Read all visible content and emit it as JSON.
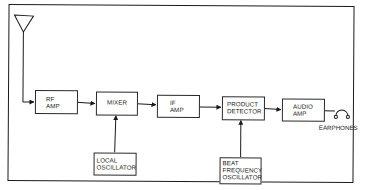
{
  "diagram": {
    "blocks": [
      {
        "id": "rf_amp",
        "lines": [
          "RF",
          "AMP"
        ]
      },
      {
        "id": "mixer",
        "lines": [
          "MIXER"
        ]
      },
      {
        "id": "if_amp",
        "lines": [
          "IF",
          "AMP"
        ]
      },
      {
        "id": "product_detector",
        "lines": [
          "PRODUCT",
          "DETECTOR"
        ]
      },
      {
        "id": "audio_amp",
        "lines": [
          "AUDIO",
          "AMP"
        ]
      },
      {
        "id": "local_oscillator",
        "lines": [
          "LOCAL",
          "OSCILLATOR"
        ]
      },
      {
        "id": "bfo",
        "lines": [
          "BEAT",
          "FREQUENCY",
          "OSCILLATOR"
        ]
      }
    ],
    "output_label": "EARPHONES",
    "connections": [
      {
        "from": "antenna",
        "to": "rf_amp"
      },
      {
        "from": "rf_amp",
        "to": "mixer"
      },
      {
        "from": "local_oscillator",
        "to": "mixer"
      },
      {
        "from": "mixer",
        "to": "if_amp"
      },
      {
        "from": "if_amp",
        "to": "product_detector"
      },
      {
        "from": "bfo",
        "to": "product_detector"
      },
      {
        "from": "product_detector",
        "to": "audio_amp"
      },
      {
        "from": "audio_amp",
        "to": "earphones"
      }
    ],
    "colors": {
      "line": "#1a1a1a",
      "background": "#ffffff"
    }
  }
}
